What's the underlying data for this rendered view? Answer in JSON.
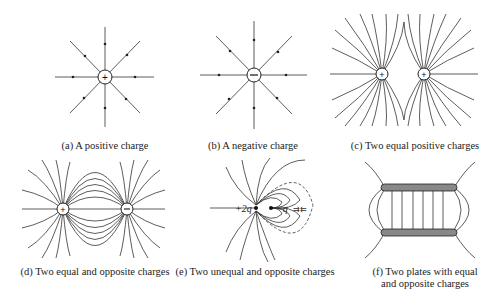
{
  "panels": [
    {
      "id": "a",
      "caption": "(a) A positive charge",
      "charges": [
        {
          "sign": "+"
        }
      ],
      "field_direction": "outward"
    },
    {
      "id": "b",
      "caption": "(b) A negative charge",
      "charges": [
        {
          "sign": "−"
        }
      ],
      "field_direction": "inward"
    },
    {
      "id": "c",
      "caption": "(c) Two equal positive charges",
      "charges": [
        {
          "sign": "+"
        },
        {
          "sign": "+"
        }
      ]
    },
    {
      "id": "d",
      "caption": "(d) Two equal and opposite charges",
      "charges": [
        {
          "sign": "+"
        },
        {
          "sign": "−"
        }
      ]
    },
    {
      "id": "e",
      "caption": "(e) Two unequal and opposite charges",
      "charges": [
        {
          "label": "+2q"
        },
        {
          "label": "−q"
        }
      ]
    },
    {
      "id": "f",
      "caption_line1": "(f) Two plates with equal",
      "caption_line2": "and opposite charges",
      "plates": [
        "top",
        "bottom"
      ]
    }
  ]
}
